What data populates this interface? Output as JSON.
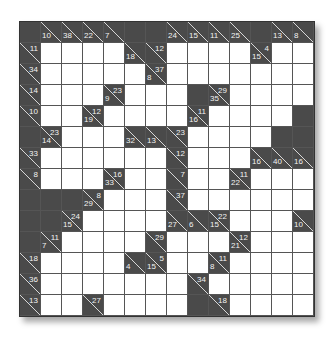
{
  "puzzle": {
    "type": "kakuro",
    "rows": 14,
    "cols": 14,
    "legend": "Cell codes: X = blocked, W = empty entry cell, object = clue cell with r (across sum) and/or d (down sum)",
    "grid": [
      [
        "X",
        {
          "d": "10"
        },
        {
          "d": "38"
        },
        {
          "d": "22"
        },
        {
          "d": "7"
        },
        "X",
        "X",
        {
          "d": "24"
        },
        {
          "d": "15"
        },
        {
          "d": "11"
        },
        {
          "d": "25"
        },
        "X",
        {
          "d": "13"
        },
        {
          "d": "8"
        }
      ],
      [
        {
          "r": "11"
        },
        "W",
        "W",
        "W",
        "W",
        {
          "d": "18"
        },
        {
          "r": "12"
        },
        "W",
        "W",
        "W",
        "W",
        {
          "r": "4",
          "d": "15"
        },
        "W",
        "W"
      ],
      [
        {
          "r": "34"
        },
        "W",
        "W",
        "W",
        "W",
        "W",
        {
          "r": "37",
          "d": "8"
        },
        "W",
        "W",
        "W",
        "W",
        "W",
        "W",
        "W"
      ],
      [
        {
          "r": "14"
        },
        "W",
        "W",
        "W",
        {
          "r": "23",
          "d": "9"
        },
        "W",
        "W",
        "W",
        "X",
        {
          "r": "29",
          "d": "35"
        },
        "W",
        "W",
        "W",
        "W"
      ],
      [
        {
          "r": "10"
        },
        "W",
        "W",
        {
          "r": "12",
          "d": "19"
        },
        "W",
        "W",
        "W",
        "W",
        {
          "r": "11",
          "d": "16"
        },
        "W",
        "W",
        "W",
        "W",
        "X"
      ],
      [
        "X",
        {
          "r": "23",
          "d": "14"
        },
        "W",
        "W",
        "W",
        {
          "d": "32"
        },
        {
          "d": "13"
        },
        {
          "r": "23"
        },
        "W",
        "W",
        "W",
        "W",
        "X",
        "X"
      ],
      [
        {
          "r": "33"
        },
        "W",
        "W",
        "W",
        "W",
        "W",
        "W",
        {
          "r": "12"
        },
        "W",
        "W",
        "W",
        {
          "d": "16"
        },
        {
          "d": "40"
        },
        {
          "d": "16"
        }
      ],
      [
        {
          "r": "8"
        },
        "W",
        "W",
        "W",
        {
          "r": "16",
          "d": "33"
        },
        "W",
        "W",
        {
          "r": "7"
        },
        "W",
        "W",
        {
          "r": "11",
          "d": "22"
        },
        "W",
        "W",
        "W"
      ],
      [
        "X",
        "X",
        "X",
        {
          "r": "8",
          "d": "29"
        },
        "W",
        "W",
        "W",
        {
          "r": "37"
        },
        "W",
        "W",
        "W",
        "W",
        "W",
        "W"
      ],
      [
        "X",
        "X",
        {
          "r": "24",
          "d": "15"
        },
        "W",
        "W",
        "W",
        "W",
        {
          "d": "27"
        },
        {
          "d": "6"
        },
        {
          "r": "22",
          "d": "15"
        },
        "W",
        "W",
        "W",
        {
          "d": "10"
        }
      ],
      [
        "X",
        {
          "r": "11",
          "d": "7"
        },
        "W",
        "W",
        "W",
        "W",
        {
          "r": "29"
        },
        "W",
        "W",
        "W",
        {
          "r": "12",
          "d": "21"
        },
        "W",
        "W",
        "W"
      ],
      [
        {
          "r": "18"
        },
        "W",
        "W",
        "W",
        "W",
        {
          "d": "4"
        },
        {
          "r": "5",
          "d": "15"
        },
        "W",
        "W",
        {
          "r": "11",
          "d": "8"
        },
        "W",
        "W",
        "W",
        "W"
      ],
      [
        {
          "r": "36"
        },
        "W",
        "W",
        "W",
        "W",
        "W",
        "W",
        "W",
        {
          "r": "34"
        },
        "W",
        "W",
        "W",
        "W",
        "W"
      ],
      [
        {
          "r": "13"
        },
        "W",
        "W",
        {
          "r": "27"
        },
        "W",
        "W",
        "W",
        "W",
        "X",
        {
          "r": "18"
        },
        "W",
        "W",
        "W",
        "W"
      ]
    ]
  },
  "colors": {
    "clue_bg": "#4a4a4a",
    "clue_text": "#f2f2f2",
    "entry_bg": "#ffffff",
    "grid_line": "#555555"
  }
}
